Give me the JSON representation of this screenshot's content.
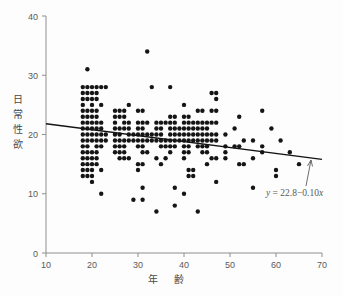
{
  "chart_data": {
    "type": "scatter",
    "title": "",
    "xlabel": "年　齢",
    "ylabel": "日常性欲",
    "xlim": [
      10,
      70
    ],
    "ylim": [
      0,
      40
    ],
    "xticks": [
      10,
      20,
      30,
      40,
      50,
      60,
      70
    ],
    "yticks": [
      0,
      10,
      20,
      30,
      40
    ],
    "grid": false,
    "legend": false,
    "annotations": [
      {
        "name": "regression-equation",
        "text": "y = 22.8 − 0.10x",
        "text_parts": {
          "y": "y",
          "equals": " = ",
          "intercept": "22.8",
          "minus": "−",
          "slope": "0.10",
          "x": "x"
        }
      }
    ],
    "fit_line": {
      "name": "regression-line",
      "equation": "y = 22.8 - 0.10x",
      "intercept": 22.8,
      "slope": -0.1,
      "x_start": 10,
      "x_end": 70,
      "y_start": 21.8,
      "y_end": 15.8
    },
    "point_color": "#151515",
    "line_color": "#141414",
    "axis_color": "#8e8e8e",
    "background_color": "#fdfdfd",
    "points": [
      [
        18,
        28
      ],
      [
        19,
        28
      ],
      [
        20,
        28
      ],
      [
        21,
        28
      ],
      [
        22,
        28
      ],
      [
        23,
        28
      ],
      [
        18,
        27
      ],
      [
        19,
        27
      ],
      [
        20,
        27
      ],
      [
        21,
        27
      ],
      [
        18,
        26
      ],
      [
        19,
        26
      ],
      [
        20,
        26
      ],
      [
        21,
        26
      ],
      [
        18,
        25
      ],
      [
        20,
        25
      ],
      [
        22,
        25
      ],
      [
        18,
        24
      ],
      [
        19,
        24
      ],
      [
        20,
        24
      ],
      [
        21,
        24
      ],
      [
        18,
        23
      ],
      [
        19,
        23
      ],
      [
        20,
        23
      ],
      [
        21,
        23
      ],
      [
        18,
        22
      ],
      [
        19,
        22
      ],
      [
        20,
        22
      ],
      [
        21,
        22
      ],
      [
        22,
        22
      ],
      [
        18,
        21
      ],
      [
        19,
        21
      ],
      [
        20,
        21
      ],
      [
        21,
        21
      ],
      [
        22,
        21
      ],
      [
        18,
        20
      ],
      [
        19,
        20
      ],
      [
        20,
        20
      ],
      [
        21,
        20
      ],
      [
        22,
        20
      ],
      [
        23,
        20
      ],
      [
        18,
        19
      ],
      [
        19,
        19
      ],
      [
        20,
        19
      ],
      [
        21,
        19
      ],
      [
        22,
        19
      ],
      [
        23,
        19
      ],
      [
        18,
        18
      ],
      [
        19,
        18
      ],
      [
        21,
        18
      ],
      [
        22,
        18
      ],
      [
        18,
        17
      ],
      [
        19,
        17
      ],
      [
        20,
        17
      ],
      [
        21,
        17
      ],
      [
        18,
        16
      ],
      [
        19,
        16
      ],
      [
        20,
        16
      ],
      [
        21,
        16
      ],
      [
        18,
        15
      ],
      [
        19,
        15
      ],
      [
        20,
        15
      ],
      [
        21,
        15
      ],
      [
        18,
        14
      ],
      [
        19,
        14
      ],
      [
        20,
        14
      ],
      [
        22,
        14
      ],
      [
        18,
        13
      ],
      [
        19,
        13
      ],
      [
        20,
        13
      ],
      [
        20,
        12
      ],
      [
        22,
        10
      ],
      [
        19,
        31
      ],
      [
        25,
        24
      ],
      [
        26,
        24
      ],
      [
        27,
        24
      ],
      [
        28,
        25
      ],
      [
        25,
        23
      ],
      [
        26,
        23
      ],
      [
        27,
        23
      ],
      [
        25,
        22
      ],
      [
        27,
        22
      ],
      [
        28,
        22
      ],
      [
        25,
        21
      ],
      [
        26,
        21
      ],
      [
        27,
        21
      ],
      [
        28,
        21
      ],
      [
        25,
        20
      ],
      [
        26,
        20
      ],
      [
        28,
        20
      ],
      [
        29,
        20
      ],
      [
        25,
        19
      ],
      [
        26,
        19
      ],
      [
        27,
        19
      ],
      [
        28,
        19
      ],
      [
        29,
        19
      ],
      [
        25,
        18
      ],
      [
        26,
        18
      ],
      [
        27,
        18
      ],
      [
        25,
        17
      ],
      [
        26,
        17
      ],
      [
        27,
        17
      ],
      [
        26,
        16
      ],
      [
        27,
        16
      ],
      [
        28,
        16
      ],
      [
        29,
        9
      ],
      [
        30,
        24
      ],
      [
        31,
        24
      ],
      [
        30,
        22
      ],
      [
        31,
        22
      ],
      [
        32,
        22
      ],
      [
        30,
        21
      ],
      [
        31,
        21
      ],
      [
        30,
        20
      ],
      [
        31,
        20
      ],
      [
        32,
        20
      ],
      [
        33,
        20
      ],
      [
        30,
        19
      ],
      [
        31,
        19
      ],
      [
        32,
        19
      ],
      [
        33,
        19
      ],
      [
        30,
        18
      ],
      [
        31,
        18
      ],
      [
        31,
        17
      ],
      [
        32,
        17
      ],
      [
        30,
        15
      ],
      [
        31,
        15
      ],
      [
        30,
        14
      ],
      [
        31,
        11
      ],
      [
        31,
        9
      ],
      [
        32,
        34
      ],
      [
        33,
        28
      ],
      [
        34,
        7
      ],
      [
        34,
        19
      ],
      [
        35,
        19
      ],
      [
        36,
        19
      ],
      [
        34,
        22
      ],
      [
        35,
        22
      ],
      [
        36,
        22
      ],
      [
        34,
        21
      ],
      [
        35,
        21
      ],
      [
        34,
        20
      ],
      [
        35,
        20
      ],
      [
        35,
        18
      ],
      [
        36,
        18
      ],
      [
        34,
        16
      ],
      [
        36,
        16
      ],
      [
        35,
        15
      ],
      [
        37,
        28
      ],
      [
        37,
        23
      ],
      [
        38,
        23
      ],
      [
        37,
        22
      ],
      [
        38,
        22
      ],
      [
        37,
        21
      ],
      [
        38,
        21
      ],
      [
        39,
        21
      ],
      [
        37,
        20
      ],
      [
        38,
        20
      ],
      [
        39,
        20
      ],
      [
        37,
        19
      ],
      [
        38,
        19
      ],
      [
        39,
        19
      ],
      [
        37,
        18
      ],
      [
        38,
        18
      ],
      [
        37,
        17
      ],
      [
        38,
        11
      ],
      [
        38,
        8
      ],
      [
        40,
        25
      ],
      [
        40,
        23
      ],
      [
        41,
        23
      ],
      [
        40,
        22
      ],
      [
        41,
        22
      ],
      [
        42,
        22
      ],
      [
        40,
        21
      ],
      [
        41,
        21
      ],
      [
        42,
        21
      ],
      [
        40,
        20
      ],
      [
        41,
        20
      ],
      [
        42,
        20
      ],
      [
        40,
        19
      ],
      [
        41,
        19
      ],
      [
        42,
        19
      ],
      [
        40,
        18
      ],
      [
        41,
        18
      ],
      [
        40,
        17
      ],
      [
        41,
        17
      ],
      [
        40,
        16
      ],
      [
        41,
        14
      ],
      [
        42,
        14
      ],
      [
        41,
        13
      ],
      [
        42,
        13
      ],
      [
        40,
        10
      ],
      [
        43,
        7
      ],
      [
        43,
        24
      ],
      [
        44,
        24
      ],
      [
        43,
        22
      ],
      [
        44,
        22
      ],
      [
        45,
        22
      ],
      [
        43,
        21
      ],
      [
        44,
        21
      ],
      [
        45,
        21
      ],
      [
        43,
        20
      ],
      [
        44,
        20
      ],
      [
        45,
        20
      ],
      [
        43,
        19
      ],
      [
        44,
        19
      ],
      [
        45,
        19
      ],
      [
        43,
        18
      ],
      [
        44,
        18
      ],
      [
        45,
        18
      ],
      [
        44,
        17
      ],
      [
        45,
        17
      ],
      [
        45,
        15
      ],
      [
        46,
        27
      ],
      [
        47,
        27
      ],
      [
        47,
        26
      ],
      [
        46,
        24
      ],
      [
        47,
        24
      ],
      [
        46,
        22
      ],
      [
        47,
        22
      ],
      [
        46,
        20
      ],
      [
        47,
        20
      ],
      [
        46,
        19
      ],
      [
        47,
        19
      ],
      [
        46,
        16
      ],
      [
        47,
        16
      ],
      [
        47,
        12
      ],
      [
        49,
        20
      ],
      [
        49,
        18
      ],
      [
        49,
        17
      ],
      [
        49,
        16
      ],
      [
        51,
        21
      ],
      [
        51,
        18
      ],
      [
        52,
        23
      ],
      [
        52,
        18
      ],
      [
        52,
        15
      ],
      [
        53,
        19
      ],
      [
        53,
        15
      ],
      [
        55,
        19
      ],
      [
        55,
        16
      ],
      [
        55,
        11
      ],
      [
        57,
        24
      ],
      [
        57,
        18
      ],
      [
        57,
        17
      ],
      [
        59,
        21
      ],
      [
        60,
        14
      ],
      [
        60,
        13
      ],
      [
        61,
        19
      ],
      [
        63,
        17
      ],
      [
        65,
        15
      ]
    ]
  },
  "axes": {
    "name": "cartesian-axes",
    "x_tick_labels": [
      "10",
      "20",
      "30",
      "40",
      "50",
      "60",
      "70"
    ],
    "y_tick_labels": [
      "0",
      "10",
      "20",
      "30",
      "40"
    ]
  },
  "labels": {
    "y_axis_chars": [
      "日",
      "常",
      "性",
      "欲"
    ],
    "x_axis_text": "年　齢"
  }
}
